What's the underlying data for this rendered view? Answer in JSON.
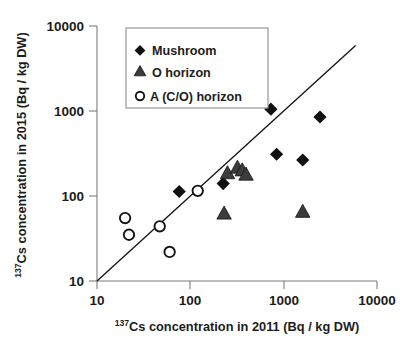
{
  "chart_data": {
    "type": "scatter",
    "title": "",
    "xlabel": "137Cs concentration in 2011 (Bq / kg DW)",
    "ylabel": "137Cs concentration in 2015 (Bq / kg DW)",
    "xlabel_prefix_sup": "137",
    "xlabel_rest": "Cs concentration in 2011 (Bq / kg DW)",
    "ylabel_prefix_sup": "137",
    "ylabel_rest": "Cs concentration in 2015 (Bq / kg DW)",
    "xscale": "log",
    "yscale": "log",
    "xlim": [
      10,
      10000
    ],
    "ylim": [
      10,
      10000
    ],
    "xticks": [
      10,
      100,
      1000,
      10000
    ],
    "yticks": [
      10,
      100,
      1000,
      10000
    ],
    "xtick_labels": [
      "10",
      "100",
      "1000",
      "10000"
    ],
    "ytick_labels": [
      "10",
      "100",
      "1000",
      "10000"
    ],
    "grid": false,
    "legend_position": "upper-left-inside",
    "reference_line": {
      "label": "1:1 line",
      "from": [
        10,
        10
      ],
      "to": [
        5900,
        5900
      ]
    },
    "series": [
      {
        "name": "Mushroom",
        "marker": "filled-diamond",
        "color": "#111111",
        "points": [
          [
            76,
            113
          ],
          [
            225,
            140
          ],
          [
            730,
            1050
          ],
          [
            840,
            310
          ],
          [
            1600,
            265
          ],
          [
            2450,
            850
          ]
        ]
      },
      {
        "name": "O horizon",
        "marker": "filled-triangle",
        "color": "#3c3c3c",
        "points": [
          [
            230,
            62
          ],
          [
            250,
            185
          ],
          [
            320,
            215
          ],
          [
            360,
            200
          ],
          [
            395,
            178
          ],
          [
            1600,
            65
          ]
        ]
      },
      {
        "name": "A (C/O) horizon",
        "marker": "open-circle",
        "color": "#ffffff",
        "points": [
          [
            20,
            55
          ],
          [
            22,
            35
          ],
          [
            47,
            44
          ],
          [
            60,
            22
          ],
          [
            120,
            115
          ]
        ]
      }
    ]
  },
  "legend": {
    "entries": [
      {
        "label": "Mushroom",
        "marker": "filled-diamond"
      },
      {
        "label": "O horizon",
        "marker": "filled-triangle"
      },
      {
        "label": "A (C/O) horizon",
        "marker": "open-circle"
      }
    ]
  },
  "axes": {
    "x_tick_labels": [
      "10",
      "100",
      "1000",
      "10000"
    ],
    "y_tick_labels": [
      "10",
      "100",
      "1000",
      "10000"
    ]
  },
  "colors": {
    "axis": "#7d7d7d",
    "line": "#141414",
    "diamond": "#111111",
    "triangle": "#3c3c3c",
    "circle_stroke": "#141414"
  }
}
